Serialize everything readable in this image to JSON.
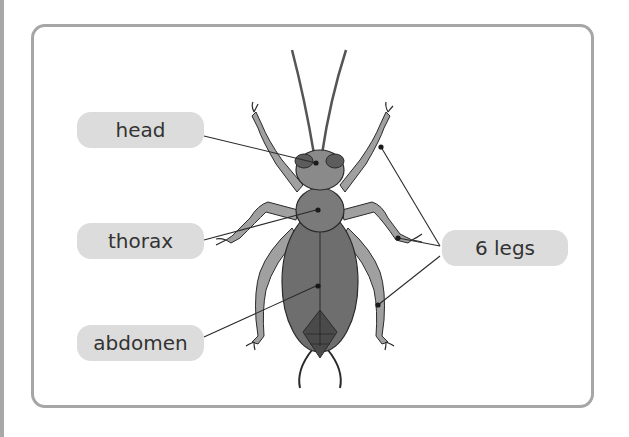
{
  "diagram": {
    "labels": {
      "head": "head",
      "thorax": "thorax",
      "abdomen": "abdomen",
      "legs": "6 legs"
    },
    "colors": {
      "frame": "#a6a6a6",
      "label_bg": "#dcdcdc",
      "head_body": "#8a8a8a",
      "thorax_body": "#7a7a7a",
      "abdomen_body": "#6e6e6e",
      "legs": "#a0a0a0",
      "tail_segment": "#4a4a4a",
      "outline": "#2a2a2a"
    }
  }
}
